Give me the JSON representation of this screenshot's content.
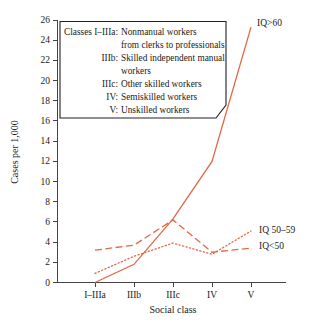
{
  "figure": {
    "background_color": "#ffffff",
    "line_color": "#e06845",
    "axis_color": "#444444"
  },
  "chart_data": {
    "type": "line",
    "title": "",
    "xlabel": "Social class",
    "ylabel": "Cases per 1,000",
    "categories": [
      "I–IIIa",
      "IIIb",
      "IIIc",
      "IV",
      "V"
    ],
    "ylim": [
      0,
      26
    ],
    "yticks": [
      0,
      2,
      4,
      6,
      8,
      10,
      12,
      14,
      16,
      18,
      20,
      22,
      24,
      26
    ],
    "ytick_labels": [
      "0",
      "2",
      "4",
      "6",
      "8",
      "10",
      "12",
      "14",
      "16",
      "18",
      "20",
      "22",
      "24",
      "26"
    ],
    "grid": false,
    "legend_position": "inline-right-of-line-ends",
    "series": [
      {
        "name": "IQ>60",
        "style": "solid",
        "color": "#e06845",
        "values": [
          0.0,
          1.8,
          6.3,
          12.0,
          25.3
        ]
      },
      {
        "name": "IQ 50–59",
        "style": "dotted",
        "color": "#e06845",
        "values": [
          0.9,
          2.6,
          3.9,
          2.8,
          5.1
        ]
      },
      {
        "name": "IQ<50",
        "style": "dashed",
        "color": "#e06845",
        "values": [
          3.2,
          3.7,
          6.2,
          3.0,
          3.4
        ]
      }
    ]
  },
  "series_labels": {
    "iq_high": "IQ>60",
    "iq_mid": "IQ 50–59",
    "iq_low": "IQ<50"
  },
  "legend_box": {
    "lines": [
      {
        "term": "Classes I–IIIa:",
        "desc": "Nonmanual workers"
      },
      {
        "term": "",
        "desc": "from clerks to professionals"
      },
      {
        "term": "IIIb:",
        "desc": "Skilled independent manual"
      },
      {
        "term": "",
        "desc": "workers"
      },
      {
        "term": "IIIc:",
        "desc": "Other skilled workers"
      },
      {
        "term": "IV:",
        "desc": "Semiskilled workers"
      },
      {
        "term": "V:",
        "desc": "Unskilled workers"
      }
    ]
  }
}
